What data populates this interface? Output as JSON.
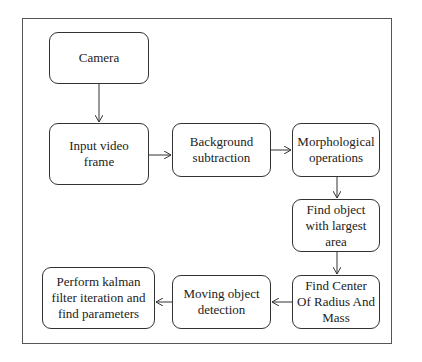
{
  "diagram": {
    "type": "flowchart",
    "nodes": [
      {
        "id": "camera",
        "label": "Camera"
      },
      {
        "id": "input",
        "label": "Input video frame"
      },
      {
        "id": "bgsub",
        "label": "Background subtraction"
      },
      {
        "id": "morph",
        "label": "Morphological operations"
      },
      {
        "id": "largest",
        "label": "Find object with largest area"
      },
      {
        "id": "center",
        "label": "Find Center Of Radius And Mass"
      },
      {
        "id": "moving",
        "label": "Moving object detection"
      },
      {
        "id": "kalman",
        "label": "Perform kalman filter iteration and find parameters"
      }
    ],
    "edges": [
      {
        "from": "camera",
        "to": "input"
      },
      {
        "from": "input",
        "to": "bgsub"
      },
      {
        "from": "bgsub",
        "to": "morph"
      },
      {
        "from": "morph",
        "to": "largest"
      },
      {
        "from": "largest",
        "to": "center"
      },
      {
        "from": "center",
        "to": "moving"
      },
      {
        "from": "moving",
        "to": "kalman"
      }
    ]
  },
  "colors": {
    "border": "#333333",
    "background": "#ffffff",
    "text": "#222222"
  }
}
